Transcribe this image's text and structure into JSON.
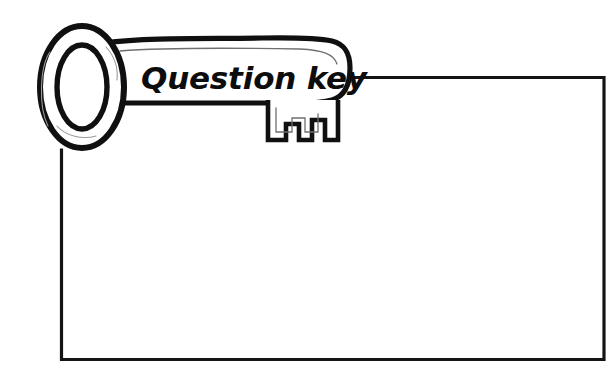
{
  "page": {
    "title": "Question key",
    "width": 615,
    "height": 370,
    "background_color": "#ffffff"
  },
  "colors": {
    "ink": "#101010",
    "frame": "#141414",
    "fill": "#ffffff",
    "sketch_hint": "#6f6f6f"
  },
  "key_banner": {
    "label": "Question key",
    "icon_name": "key-icon",
    "description": "Hand-drawn key outline overlapping the top-left corner of the content frame"
  },
  "content_frame": {
    "label": "",
    "placeholder": "",
    "note": "Empty bordered content area"
  }
}
